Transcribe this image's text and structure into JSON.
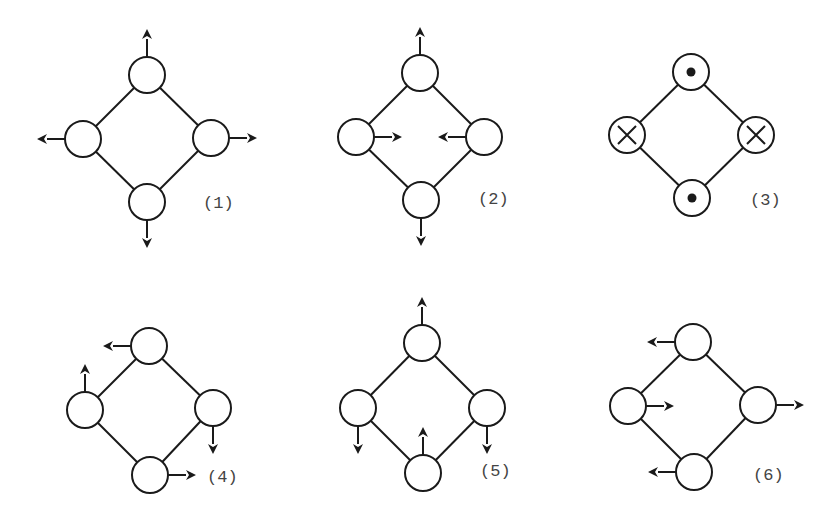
{
  "figure": {
    "width": 839,
    "height": 510,
    "node_radius": 18,
    "arrow_length": 28,
    "colors": {
      "stroke": "#1a1a1a",
      "label": "#444444",
      "background": "#ffffff"
    }
  },
  "diagrams": [
    {
      "id": 1,
      "label": "(1)",
      "label_pos": [
        203,
        208
      ],
      "nodes": {
        "top": {
          "c": [
            147,
            75
          ],
          "mark": "none",
          "arrow": "up"
        },
        "left": {
          "c": [
            83,
            139
          ],
          "mark": "none",
          "arrow": "left"
        },
        "right": {
          "c": [
            211,
            138
          ],
          "mark": "none",
          "arrow": "right"
        },
        "bottom": {
          "c": [
            147,
            202
          ],
          "mark": "none",
          "arrow": "down"
        }
      }
    },
    {
      "id": 2,
      "label": "(2)",
      "label_pos": [
        478,
        204
      ],
      "nodes": {
        "top": {
          "c": [
            420,
            73
          ],
          "mark": "none",
          "arrow": "up"
        },
        "left": {
          "c": [
            356,
            137
          ],
          "mark": "none",
          "arrow": "right"
        },
        "right": {
          "c": [
            484,
            137
          ],
          "mark": "none",
          "arrow": "left"
        },
        "bottom": {
          "c": [
            421,
            200
          ],
          "mark": "none",
          "arrow": "down"
        }
      }
    },
    {
      "id": 3,
      "label": "(3)",
      "label_pos": [
        750,
        205
      ],
      "nodes": {
        "top": {
          "c": [
            691,
            72
          ],
          "mark": "dot",
          "arrow": "none"
        },
        "left": {
          "c": [
            627,
            135
          ],
          "mark": "cross",
          "arrow": "none"
        },
        "right": {
          "c": [
            756,
            135
          ],
          "mark": "cross",
          "arrow": "none"
        },
        "bottom": {
          "c": [
            692,
            198
          ],
          "mark": "dot",
          "arrow": "none"
        }
      }
    },
    {
      "id": 4,
      "label": "(4)",
      "label_pos": [
        207,
        482
      ],
      "nodes": {
        "top": {
          "c": [
            149,
            346
          ],
          "mark": "none",
          "arrow": "left"
        },
        "left": {
          "c": [
            85,
            410
          ],
          "mark": "none",
          "arrow": "up"
        },
        "right": {
          "c": [
            213,
            408
          ],
          "mark": "none",
          "arrow": "down"
        },
        "bottom": {
          "c": [
            150,
            475
          ],
          "mark": "none",
          "arrow": "right"
        }
      }
    },
    {
      "id": 5,
      "label": "(5)",
      "label_pos": [
        480,
        476
      ],
      "nodes": {
        "top": {
          "c": [
            422,
            343
          ],
          "mark": "none",
          "arrow": "up"
        },
        "left": {
          "c": [
            358,
            408
          ],
          "mark": "none",
          "arrow": "down"
        },
        "right": {
          "c": [
            487,
            408
          ],
          "mark": "none",
          "arrow": "down"
        },
        "bottom": {
          "c": [
            423,
            473
          ],
          "mark": "none",
          "arrow": "up"
        }
      }
    },
    {
      "id": 6,
      "label": "(6)",
      "label_pos": [
        753,
        480
      ],
      "nodes": {
        "top": {
          "c": [
            693,
            342
          ],
          "mark": "none",
          "arrow": "left"
        },
        "left": {
          "c": [
            628,
            406
          ],
          "mark": "none",
          "arrow": "right"
        },
        "right": {
          "c": [
            758,
            405
          ],
          "mark": "none",
          "arrow": "right"
        },
        "bottom": {
          "c": [
            694,
            472
          ],
          "mark": "none",
          "arrow": "left"
        }
      }
    }
  ]
}
